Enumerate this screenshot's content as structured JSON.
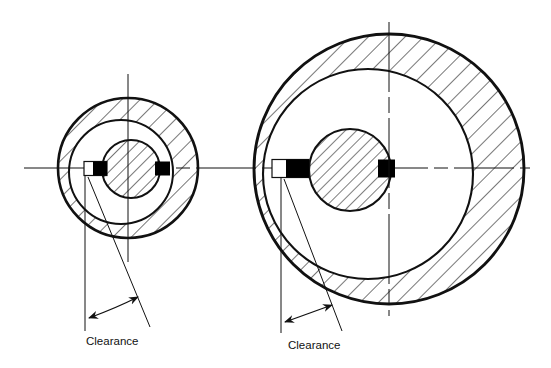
{
  "figure": {
    "background_color": "#ffffff",
    "line_color": "#111111",
    "keyway_fill": "#000000",
    "hatch_color": "#111111"
  },
  "labels": {
    "clearance_left": "Clearance",
    "clearance_right": "Clearance"
  },
  "views": [
    {
      "name": "small-bearing-view",
      "center": {
        "x": 128,
        "y": 168
      },
      "outer_radius": 70,
      "bore": {
        "cx": 121,
        "cy": 172,
        "r": 52
      },
      "shaft": {
        "cx": 131,
        "cy": 169,
        "r": 29
      },
      "keyway_left": {
        "x": 84,
        "y": 162,
        "w": 22,
        "h": 14
      },
      "keyway_right": {
        "x": 155,
        "y": 162,
        "w": 15,
        "h": 14
      },
      "clearance_angle_deg": 22,
      "vertical_centerline": {
        "x": 128,
        "y1": 74,
        "y2": 262
      },
      "dim_vertical_line": {
        "x": 85,
        "y1": 178,
        "y2": 330
      },
      "dim_angled_line": {
        "x1": 88,
        "y1": 178,
        "x2": 148,
        "y2": 325
      },
      "arc_arrow": {
        "cx": 85,
        "cy": 178,
        "r": 145,
        "a1": 92,
        "a2": 67
      },
      "label_pos": {
        "x": 86,
        "y": 345
      }
    },
    {
      "name": "large-bearing-view",
      "center": {
        "x": 389,
        "y": 169
      },
      "outer_radius": 135,
      "bore": {
        "cx": 368,
        "cy": 174,
        "r": 105
      },
      "shaft": {
        "cx": 350,
        "cy": 170,
        "r": 41
      },
      "keyway_left": {
        "x": 273,
        "y": 160,
        "w": 35,
        "h": 18
      },
      "keyway_right": {
        "x": 378,
        "y": 160,
        "w": 17,
        "h": 18
      },
      "clearance_angle_deg": 20,
      "vertical_centerline": {
        "x": 389,
        "y": 169,
        "y1": 22,
        "y2": 316
      },
      "dim_vertical_line": {
        "x": 281,
        "y1": 180,
        "y2": 333
      },
      "dim_angled_line": {
        "x1": 284,
        "y1": 180,
        "x2": 340,
        "y2": 330
      },
      "arc_arrow": {
        "cx": 281,
        "cy": 180,
        "r": 148,
        "a1": 92,
        "a2": 68
      },
      "label_pos": {
        "x": 288,
        "y": 349
      }
    }
  ],
  "centerline": {
    "name": "horizontal-centerline",
    "y": 168,
    "x1": 24,
    "x2": 530,
    "style": "dash-dot"
  }
}
